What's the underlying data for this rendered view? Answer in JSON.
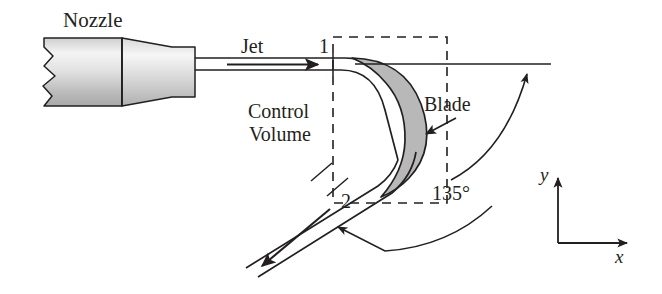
{
  "figure": {
    "background_color": "#ffffff",
    "line_color": "#231f20",
    "blade_fill_color": "#b8b8b8",
    "nozzle_fill_light": "#f2f2f2",
    "nozzle_fill_dark": "#bdbdbd"
  },
  "labels": {
    "nozzle": "Nozzle",
    "jet": "Jet",
    "station_in": "1",
    "station_out": "2",
    "control": "Control",
    "volume": "Volume",
    "blade": "Blade",
    "angle": "135°",
    "axis_y": "y",
    "axis_x": "x"
  },
  "diagram_data": {
    "type": "schematic",
    "deflection_angle_deg": 135,
    "inlet_station": "1",
    "outlet_station": "2",
    "inlet_flow_direction": "horizontal-right",
    "outlet_flow_direction": "down-left-45deg",
    "control_volume": {
      "style": "dashed rectangle",
      "left": 333,
      "top": 37,
      "right": 447,
      "bottom": 203
    },
    "axes": {
      "origin": [
        558,
        243
      ],
      "y_tip": [
        558,
        175
      ],
      "x_tip": [
        628,
        243
      ]
    }
  }
}
